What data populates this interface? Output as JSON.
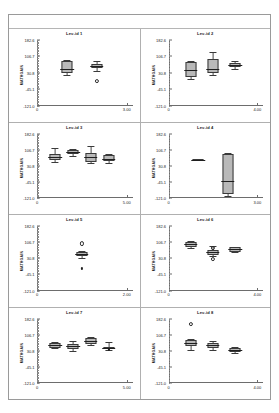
{
  "figure": {
    "y_axis_label": "MATHGAIN",
    "y_ticks": [
      "182.6",
      "106.7",
      "30.8",
      "-45.1",
      "-121.0"
    ],
    "y_tick_values": [
      182.6,
      106.7,
      30.8,
      -45.1,
      -121.0
    ],
    "ylim": [
      -121.0,
      182.6
    ],
    "x_origin_label": "0"
  },
  "chart_data": {
    "type": "box",
    "title": "",
    "ylabel": "MATHGAIN",
    "xlabel": "",
    "ylim": [
      -121.0,
      182.6
    ],
    "y_ticks": [
      182.6,
      106.7,
      30.8,
      -45.1,
      -121.0
    ],
    "grid": false,
    "legend": "none",
    "layout": {
      "rows": 4,
      "cols": 2
    },
    "panels": [
      {
        "title": "Lev-id 1",
        "x_max_label": "3.00",
        "x_max": 3.0,
        "boxes": [
          {
            "x": 1.0,
            "q1": 30.0,
            "median": 47.0,
            "q3": 86.0,
            "low": 22.0,
            "high": 92.0
          },
          {
            "x": 2.0,
            "q1": 52.0,
            "median": 62.0,
            "q3": 72.0,
            "low": 38.0,
            "high": 86.0
          }
        ],
        "outliers_open": [
          {
            "x": 2.0,
            "y": -8.0
          }
        ],
        "outliers_filled": []
      },
      {
        "title": "Lev-id 2",
        "x_max_label": "4.00",
        "x_max": 4.0,
        "boxes": [
          {
            "x": 1.0,
            "q1": 10.0,
            "median": 44.0,
            "q3": 82.0,
            "low": 4.0,
            "high": 86.0
          },
          {
            "x": 2.0,
            "q1": 28.0,
            "median": 46.0,
            "q3": 94.0,
            "low": 22.0,
            "high": 128.0
          },
          {
            "x": 3.0,
            "q1": 58.0,
            "median": 66.0,
            "q3": 76.0,
            "low": 48.0,
            "high": 86.0
          }
        ],
        "outliers_open": [],
        "outliers_filled": []
      },
      {
        "title": "Lev-id 3",
        "x_max_label": "5.00",
        "x_max": 5.0,
        "boxes": [
          {
            "x": 1.0,
            "q1": 60.0,
            "median": 70.0,
            "q3": 86.0,
            "low": 50.0,
            "high": 112.0
          },
          {
            "x": 2.0,
            "q1": 84.0,
            "median": 94.0,
            "q3": 104.0,
            "low": 78.0,
            "high": 110.0
          },
          {
            "x": 3.0,
            "q1": 50.0,
            "median": 72.0,
            "q3": 90.0,
            "low": 44.0,
            "high": 124.0
          },
          {
            "x": 4.0,
            "q1": 52.0,
            "median": 62.0,
            "q3": 82.0,
            "low": 46.0,
            "high": 88.0
          }
        ],
        "outliers_open": [],
        "outliers_filled": []
      },
      {
        "title": "Lev-id 4",
        "x_max_label": "3.00",
        "x_max": 3.0,
        "boxes": [
          {
            "x": 1.0,
            "q1": 56.0,
            "median": 60.0,
            "q3": 64.0,
            "low": 56.0,
            "high": 64.0
          },
          {
            "x": 2.0,
            "q1": -104.0,
            "median": -40.0,
            "q3": 86.0,
            "low": -112.0,
            "high": 92.0
          }
        ],
        "outliers_open": [],
        "outliers_filled": []
      },
      {
        "title": "Lev-id 5",
        "x_max_label": "2.00",
        "x_max": 2.0,
        "boxes": [
          {
            "x": 1.0,
            "q1": 42.0,
            "median": 52.0,
            "q3": 60.0,
            "low": 34.0,
            "high": 66.0
          }
        ],
        "outliers_open": [
          {
            "x": 1.0,
            "y": 100.0
          }
        ],
        "outliers_filled": [
          {
            "x": 1.0,
            "y": -18.0
          }
        ]
      },
      {
        "title": "Lev-id 6",
        "x_max_label": "4.00",
        "x_max": 4.0,
        "boxes": [
          {
            "x": 1.0,
            "q1": 84.0,
            "median": 96.0,
            "q3": 108.0,
            "low": 80.0,
            "high": 112.0
          },
          {
            "x": 2.0,
            "q1": 48.0,
            "median": 58.0,
            "q3": 68.0,
            "low": 40.0,
            "high": 88.0
          },
          {
            "x": 3.0,
            "q1": 62.0,
            "median": 72.0,
            "q3": 82.0,
            "low": 58.0,
            "high": 86.0
          }
        ],
        "outliers_open": [
          {
            "x": 2.0,
            "y": 80.0
          },
          {
            "x": 2.0,
            "y": 26.0
          }
        ],
        "outliers_filled": []
      },
      {
        "title": "Lev-id 7",
        "x_max_label": "5.00",
        "x_max": 5.0,
        "boxes": [
          {
            "x": 1.0,
            "q1": 46.0,
            "median": 56.0,
            "q3": 66.0,
            "low": 42.0,
            "high": 70.0
          },
          {
            "x": 2.0,
            "q1": 40.0,
            "median": 52.0,
            "q3": 64.0,
            "low": 28.0,
            "high": 76.0
          },
          {
            "x": 3.0,
            "q1": 62.0,
            "median": 76.0,
            "q3": 92.0,
            "low": 56.0,
            "high": 96.0
          },
          {
            "x": 4.0,
            "q1": 40.0,
            "median": 44.0,
            "q3": 48.0,
            "low": 34.0,
            "high": 72.0
          }
        ],
        "outliers_open": [],
        "outliers_filled": [
          {
            "x": 4.0,
            "y": 36.0
          }
        ]
      },
      {
        "title": "Lev-id 8",
        "x_max_label": "4.00",
        "x_max": 4.0,
        "boxes": [
          {
            "x": 1.0,
            "q1": 52.0,
            "median": 68.0,
            "q3": 82.0,
            "low": 34.0,
            "high": 88.0
          },
          {
            "x": 2.0,
            "q1": 44.0,
            "median": 56.0,
            "q3": 68.0,
            "low": 34.0,
            "high": 76.0
          },
          {
            "x": 3.0,
            "q1": 24.0,
            "median": 32.0,
            "q3": 42.0,
            "low": 18.0,
            "high": 48.0
          }
        ],
        "outliers_open": [
          {
            "x": 1.0,
            "y": 158.0
          }
        ],
        "outliers_filled": []
      }
    ]
  }
}
